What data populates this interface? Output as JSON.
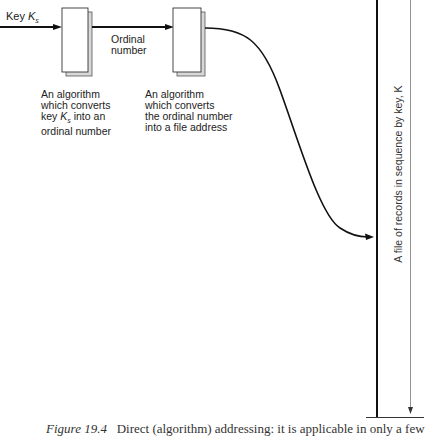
{
  "diagram": {
    "input_label": {
      "prefix": "Key ",
      "key": "K",
      "subscript": "s"
    },
    "edge_label": [
      "Ordinal",
      "number"
    ],
    "boxes": [
      {
        "name": "algorithm-key-to-ordinal",
        "description_lines": [
          "An algorithm",
          "which converts",
          "key K_s into an",
          "ordinal number"
        ],
        "desc_line1": "An algorithm",
        "desc_line2": "which converts",
        "desc_line3_prefix": "key ",
        "desc_line3_key": "K",
        "desc_line3_sub": "s",
        "desc_line3_suffix": " into an",
        "desc_line4": "ordinal number"
      },
      {
        "name": "algorithm-ordinal-to-address",
        "description_lines": [
          "An algorithm",
          "which converts",
          "the ordinal number",
          "into a file address"
        ],
        "desc_line1": "An algorithm",
        "desc_line2": "which converts",
        "desc_line3": "the ordinal number",
        "desc_line4": "into a file address"
      }
    ],
    "file_label": "A file of records in sequence by key, K",
    "colors": {
      "line": "#111111",
      "shadow": "#bbbbbb",
      "thin_line": "#666666"
    }
  },
  "caption": {
    "figure": "Figure 19.4",
    "text": "Direct (algorithm) addressing: it is applicable in only a few"
  }
}
